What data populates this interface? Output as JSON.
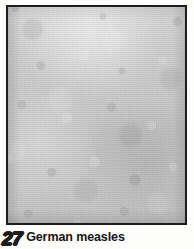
{
  "page": {
    "background_color": "#fdfdfb",
    "kind": "medical-textbook-photo-plate"
  },
  "plate": {
    "image_alt": "Close-up grayscale photograph of mottled skin rash",
    "frame_color": "#1c1c1c",
    "base_tone": "#c8c8c8",
    "subject": "skin-rash-texture"
  },
  "caption": {
    "number": "27",
    "text": "German measles",
    "number_style": "outlined-italic",
    "text_color": "#151515"
  }
}
